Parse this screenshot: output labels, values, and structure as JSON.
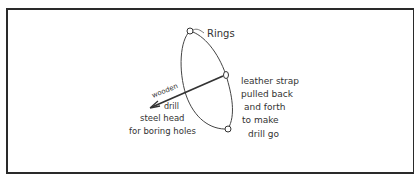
{
  "diagram": {
    "labels": {
      "rings": "Rings",
      "wooden": "wooden",
      "drill": "drill",
      "steel_head_line1": "steel head",
      "steel_head_line2": "for boring holes",
      "strap_line1": "leather strap",
      "strap_line2": "pulled back",
      "strap_line3": "and forth",
      "strap_line4": "to make",
      "strap_line5": "drill go"
    },
    "colors": {
      "ink": "#333333",
      "border": "#2a2a2a",
      "background": "#ffffff"
    }
  }
}
